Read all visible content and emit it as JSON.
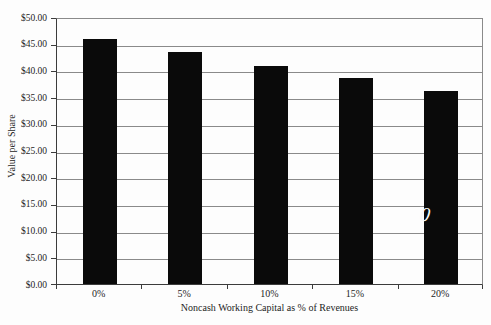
{
  "chart_data": {
    "type": "bar",
    "title": "",
    "categories": [
      "0%",
      "5%",
      "10%",
      "15%",
      "20%"
    ],
    "values": [
      45.9,
      43.4,
      40.8,
      38.5,
      36.1
    ],
    "xlabel": "Noncash Working Capital as % of Revenues",
    "ylabel": "Value per Share",
    "ylim": [
      0,
      50
    ],
    "ytick_step": 5,
    "yticks": [
      {
        "value": 50,
        "label": "$50.00"
      },
      {
        "value": 45,
        "label": "$45.00"
      },
      {
        "value": 40,
        "label": "$40.00"
      },
      {
        "value": 35,
        "label": "$35.00"
      },
      {
        "value": 30,
        "label": "$30.00"
      },
      {
        "value": 25,
        "label": "$25.00"
      },
      {
        "value": 20,
        "label": "$20.00"
      },
      {
        "value": 15,
        "label": "$15.00"
      },
      {
        "value": 10,
        "label": "$10.00"
      },
      {
        "value": 5,
        "label": "$5.00"
      },
      {
        "value": 0,
        "label": "$0.00"
      }
    ],
    "grid": true,
    "legend": "none",
    "bar_gap_ratio": 1.5,
    "colors": {
      "bar": "#0a0a0a",
      "gridline": "#8a8a8a",
      "axis": "#3c3c3c",
      "background": "#fdfdfd",
      "stray_mark": "#f8f8f8"
    },
    "stray_mark": {
      "text": "0",
      "on_category": "20%"
    }
  }
}
